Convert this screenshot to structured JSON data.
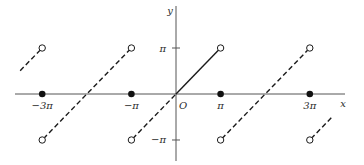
{
  "chart_data": {
    "type": "line",
    "title": "",
    "xlabel": "x",
    "ylabel": "y",
    "origin_label": "O",
    "x_ticks": [
      {
        "value": -9.42478,
        "label": "−3π"
      },
      {
        "value": -3.14159,
        "label": "−π"
      },
      {
        "value": 3.14159,
        "label": "π"
      },
      {
        "value": 9.42478,
        "label": "3π"
      }
    ],
    "y_ticks": [
      {
        "value": 3.14159,
        "label": "π"
      },
      {
        "value": -3.14159,
        "label": "−π"
      }
    ],
    "xlim": [
      -11.0,
      12.0
    ],
    "ylim": [
      -4.5,
      6.0
    ],
    "grid": false,
    "series": [
      {
        "name": "segment_k_-2",
        "style": "dashed",
        "x": [
          -12.566,
          -9.42478
        ],
        "y": [
          -3.14159,
          3.14159
        ],
        "visible_x_range": [
          -11.0,
          -9.42478
        ]
      },
      {
        "name": "segment_k_-1",
        "style": "dashed",
        "x": [
          -9.42478,
          -3.14159
        ],
        "y": [
          -3.14159,
          3.14159
        ]
      },
      {
        "name": "segment_k_0",
        "style": "solid",
        "x": [
          -3.14159,
          3.14159
        ],
        "y": [
          -3.14159,
          3.14159
        ],
        "note": "dashed to the left of origin, solid for x in [0, pi)"
      },
      {
        "name": "segment_k_1",
        "style": "dashed",
        "x": [
          3.14159,
          9.42478
        ],
        "y": [
          -3.14159,
          3.14159
        ]
      },
      {
        "name": "segment_k_2",
        "style": "dashed",
        "x": [
          9.42478,
          15.708
        ],
        "y": [
          -3.14159,
          3.14159
        ],
        "visible_x_range": [
          9.42478,
          11.0
        ]
      }
    ],
    "open_points": [
      {
        "x": -9.42478,
        "y": 3.14159
      },
      {
        "x": -9.42478,
        "y": -3.14159
      },
      {
        "x": -3.14159,
        "y": 3.14159
      },
      {
        "x": -3.14159,
        "y": -3.14159
      },
      {
        "x": 3.14159,
        "y": 3.14159
      },
      {
        "x": 3.14159,
        "y": -3.14159
      },
      {
        "x": 9.42478,
        "y": 3.14159
      },
      {
        "x": 9.42478,
        "y": -3.14159
      }
    ],
    "filled_points": [
      {
        "x": -9.42478,
        "y": 0
      },
      {
        "x": -3.14159,
        "y": 0
      },
      {
        "x": 3.14159,
        "y": 0
      },
      {
        "x": 9.42478,
        "y": 0
      }
    ]
  }
}
